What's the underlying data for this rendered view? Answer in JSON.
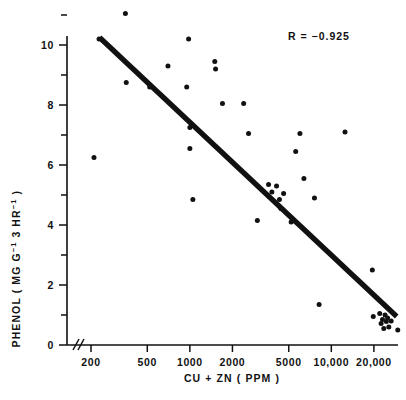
{
  "chart_data": {
    "type": "scatter",
    "title": "",
    "xlabel": "CU + ZN  ( PPM )",
    "ylabel": "PHENOL ( MG G-1 3 HR-1 )",
    "ylabel_parts": {
      "prefix": "PHENOL ( MG G",
      "sup1": "−1",
      "mid": " 3 HR",
      "sup2": "−1",
      "suffix": " )"
    },
    "xscale": "log",
    "yscale": "linear",
    "xlim": [
      170,
      32000
    ],
    "ylim": [
      0,
      11.6
    ],
    "grid": false,
    "legend": null,
    "axis_break": true,
    "axis_break_note": "double slash break on x-axis just right of origin",
    "xticks": [
      200,
      500,
      1000,
      2000,
      5000,
      10000,
      20000
    ],
    "xticklabels": [
      "200",
      "500",
      "1000",
      "2000",
      "5000",
      "10,000",
      "20,000"
    ],
    "yticks": [
      0,
      1,
      2,
      3,
      4,
      5,
      6,
      7,
      8,
      9,
      10,
      11
    ],
    "yticklabels_major": [
      "0",
      "2",
      "4",
      "6",
      "8",
      "10"
    ],
    "ymajor": [
      0,
      2,
      4,
      6,
      8,
      10
    ],
    "annotations": [
      {
        "name": "correlation",
        "text": "R = −0.925",
        "x_px": 288,
        "y_px": 40
      }
    ],
    "regression": {
      "label": "least-squares fit line",
      "x_start": 230,
      "y_start": 10.25,
      "x_end": 29000,
      "y_end": 0.95
    },
    "points": [
      {
        "x": 228,
        "y": 10.2
      },
      {
        "x": 210,
        "y": 6.25
      },
      {
        "x": 350,
        "y": 11.05
      },
      {
        "x": 355,
        "y": 8.75
      },
      {
        "x": 520,
        "y": 8.6
      },
      {
        "x": 700,
        "y": 9.3
      },
      {
        "x": 980,
        "y": 10.2
      },
      {
        "x": 950,
        "y": 8.6
      },
      {
        "x": 1000,
        "y": 7.25
      },
      {
        "x": 1000,
        "y": 6.55
      },
      {
        "x": 1050,
        "y": 4.85
      },
      {
        "x": 1500,
        "y": 9.45
      },
      {
        "x": 1520,
        "y": 9.2
      },
      {
        "x": 1700,
        "y": 8.05
      },
      {
        "x": 2400,
        "y": 8.05
      },
      {
        "x": 2600,
        "y": 7.05
      },
      {
        "x": 3000,
        "y": 4.15
      },
      {
        "x": 3600,
        "y": 5.35
      },
      {
        "x": 3800,
        "y": 5.1
      },
      {
        "x": 4100,
        "y": 5.3
      },
      {
        "x": 4300,
        "y": 4.85
      },
      {
        "x": 4400,
        "y": 4.55
      },
      {
        "x": 4600,
        "y": 5.05
      },
      {
        "x": 5200,
        "y": 4.1
      },
      {
        "x": 5600,
        "y": 6.45
      },
      {
        "x": 6000,
        "y": 7.05
      },
      {
        "x": 6400,
        "y": 5.55
      },
      {
        "x": 7600,
        "y": 4.9
      },
      {
        "x": 8200,
        "y": 1.35
      },
      {
        "x": 12500,
        "y": 7.1
      },
      {
        "x": 19500,
        "y": 2.5
      },
      {
        "x": 19800,
        "y": 0.95
      },
      {
        "x": 22000,
        "y": 1.05
      },
      {
        "x": 22500,
        "y": 0.72
      },
      {
        "x": 23000,
        "y": 0.85
      },
      {
        "x": 23500,
        "y": 0.55
      },
      {
        "x": 24000,
        "y": 1.0
      },
      {
        "x": 24500,
        "y": 0.78
      },
      {
        "x": 25000,
        "y": 0.9
      },
      {
        "x": 25500,
        "y": 0.6
      },
      {
        "x": 26500,
        "y": 0.8
      },
      {
        "x": 29500,
        "y": 0.5
      }
    ]
  }
}
